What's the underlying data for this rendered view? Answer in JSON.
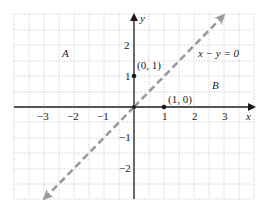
{
  "diagram": {
    "type": "coordinate-plane",
    "grid": {
      "xmin": -4,
      "xmax": 4,
      "ymin": -3,
      "ymax": 3,
      "minor_step": 0.5
    },
    "axes": {
      "x_label": "x",
      "y_label": "y",
      "x_ticks": [
        {
          "value": -3,
          "label": "−3"
        },
        {
          "value": -2,
          "label": "−2"
        },
        {
          "value": -1,
          "label": "−1"
        },
        {
          "value": 1,
          "label": "1"
        },
        {
          "value": 2,
          "label": "2"
        },
        {
          "value": 3,
          "label": "3"
        }
      ],
      "y_ticks": [
        {
          "value": 2,
          "label": "2"
        },
        {
          "value": 1,
          "label": "1"
        },
        {
          "value": -1,
          "label": "−1"
        },
        {
          "value": -2,
          "label": "−2"
        }
      ]
    },
    "line": {
      "equation": "x − y = 0",
      "style": "dashed",
      "color": "#9a9a9a"
    },
    "points": [
      {
        "label": "(0, 1)",
        "x": 0,
        "y": 1
      },
      {
        "label": "(1, 0)",
        "x": 1,
        "y": 0
      }
    ],
    "regions": [
      {
        "label": "A"
      },
      {
        "label": "B"
      }
    ],
    "colors": {
      "grid": "#b8b8b8",
      "axis": "#1a1a1a",
      "line": "#9a9a9a"
    }
  }
}
